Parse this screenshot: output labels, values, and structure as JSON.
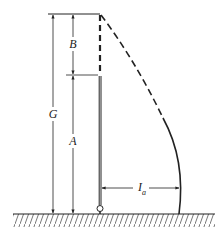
{
  "diagram": {
    "labels": {
      "B": "B",
      "G": "G",
      "A": "A",
      "current_main": "I",
      "current_sub": "a"
    },
    "colors": {
      "stroke": "#222222",
      "background": "#ffffff"
    }
  }
}
